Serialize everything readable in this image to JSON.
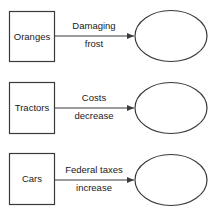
{
  "diagram": {
    "rows": [
      {
        "source": "Oranges",
        "label_line1": "Damaging",
        "label_line2": "frost",
        "target": ""
      },
      {
        "source": "Tractors",
        "label_line1": "Costs",
        "label_line2": "decrease",
        "target": ""
      },
      {
        "source": "Cars",
        "label_line1": "Federal taxes",
        "label_line2": "increase",
        "target": ""
      }
    ],
    "colors": {
      "stroke": "#3a3a3a",
      "text": "#1a1a1a",
      "background": "#ffffff"
    }
  }
}
